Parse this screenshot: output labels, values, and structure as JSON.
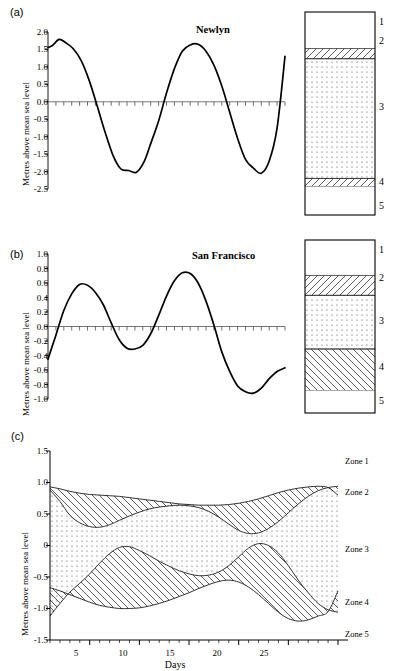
{
  "figure": {
    "panels": [
      {
        "tag": "(a)",
        "title": "Newlyn",
        "ylabel": "Metres above mean sea level",
        "yticks": [
          "2.0",
          "1.5",
          "1.0",
          "0.5",
          "0.0",
          "-0.5",
          "-1.0",
          "-1.5",
          "-2.0",
          "-2.5"
        ]
      },
      {
        "tag": "(b)",
        "title": "San Francisco",
        "ylabel": "Metres above mean sea level",
        "yticks": [
          "1.0",
          "0.8",
          "0.6",
          "0.4",
          "0.2",
          "0.0",
          "-0.2",
          "-0.4",
          "-0.6",
          "-0.8",
          "-1.0"
        ]
      },
      {
        "tag": "(c)",
        "title": "",
        "ylabel": "Metres above mean sea level",
        "xlabel": "Days",
        "yticks": [
          "1.5",
          "1.0",
          "0.5",
          "0",
          "-0.5",
          "-1.0",
          "-1.5"
        ],
        "xticks": [
          "5",
          "10",
          "15",
          "20",
          "25"
        ],
        "zone_labels": [
          "Zone 1",
          "Zone 2",
          "Zone 3",
          "Zone 4",
          "Zone 5"
        ]
      }
    ],
    "column_numbers": [
      "1",
      "2",
      "3",
      "4",
      "5"
    ]
  },
  "chart_data": [
    {
      "type": "line",
      "title": "Newlyn",
      "xlabel": "",
      "ylabel": "Metres above mean sea level",
      "ylim": [
        -2.5,
        2.0
      ],
      "xlim": [
        0,
        30
      ],
      "yticks": [
        2.0,
        1.5,
        1.0,
        0.5,
        0.0,
        -0.5,
        -1.0,
        -1.5,
        -2.0,
        -2.5
      ],
      "grid": false,
      "legend": "none",
      "series": [
        {
          "name": "Newlyn sea level",
          "x": [
            0,
            0.6,
            1.4,
            2.2,
            3.2,
            4.2,
            5.2,
            6.2,
            7.2,
            8.2,
            9.2,
            10.2,
            11.2,
            12.2,
            13.0,
            14.0,
            15.0,
            16.0,
            17.0,
            18.0,
            19.0,
            20.0,
            21.0,
            22.0,
            23.0,
            24.0,
            25.0,
            26.0,
            27.0,
            28.0,
            29.0,
            30.0
          ],
          "y": [
            1.55,
            1.62,
            1.79,
            1.7,
            1.52,
            1.18,
            0.62,
            -0.1,
            -0.85,
            -1.52,
            -1.92,
            -1.97,
            -2.02,
            -1.7,
            -1.2,
            -0.55,
            0.25,
            0.95,
            1.45,
            1.63,
            1.65,
            1.45,
            1.05,
            0.45,
            -0.3,
            -1.05,
            -1.65,
            -1.9,
            -2.05,
            -1.7,
            -0.75,
            1.3
          ]
        }
      ]
    },
    {
      "type": "line",
      "title": "San Francisco",
      "xlabel": "",
      "ylabel": "Metres above mean sea level",
      "ylim": [
        -1.0,
        1.0
      ],
      "xlim": [
        0,
        30
      ],
      "yticks": [
        1.0,
        0.8,
        0.6,
        0.4,
        0.2,
        0.0,
        -0.2,
        -0.4,
        -0.6,
        -0.8,
        -1.0
      ],
      "grid": false,
      "legend": "none",
      "series": [
        {
          "name": "San Francisco sea level",
          "x": [
            0,
            1,
            2,
            3,
            4,
            5,
            6,
            7,
            8,
            9,
            10,
            11,
            12,
            13,
            14,
            15,
            16,
            17,
            18,
            19,
            20,
            21,
            22,
            23,
            24,
            25,
            26,
            27,
            28,
            29,
            30
          ],
          "y": [
            -0.45,
            -0.12,
            0.22,
            0.45,
            0.58,
            0.57,
            0.47,
            0.3,
            0.05,
            -0.18,
            -0.3,
            -0.31,
            -0.26,
            -0.1,
            0.15,
            0.42,
            0.63,
            0.74,
            0.73,
            0.6,
            0.35,
            0.02,
            -0.35,
            -0.62,
            -0.82,
            -0.9,
            -0.92,
            -0.85,
            -0.72,
            -0.62,
            -0.57
          ]
        }
      ]
    },
    {
      "type": "area",
      "title": "",
      "xlabel": "Days",
      "ylabel": "Metres above mean sea level",
      "ylim": [
        -1.5,
        1.5
      ],
      "xlim": [
        1,
        30
      ],
      "yticks": [
        1.5,
        1.0,
        0.5,
        0,
        -0.5,
        -1.0,
        -1.5
      ],
      "xticks": [
        5,
        10,
        15,
        20,
        25
      ],
      "grid": false,
      "legend": "right",
      "zones": [
        "Zone 1",
        "Zone 2",
        "Zone 3",
        "Zone 4",
        "Zone 5"
      ],
      "series": [
        {
          "name": "upper-envelope-top (zone1/zone2 boundary)",
          "x": [
            1,
            2,
            3,
            4,
            5,
            6,
            7,
            8,
            9,
            10,
            11,
            12,
            13,
            14,
            15,
            16,
            17,
            18,
            19,
            20,
            21,
            22,
            23,
            24,
            25,
            26,
            27,
            28,
            29,
            30
          ],
          "y": [
            0.93,
            0.9,
            0.86,
            0.83,
            0.81,
            0.8,
            0.79,
            0.78,
            0.76,
            0.74,
            0.72,
            0.7,
            0.68,
            0.66,
            0.65,
            0.64,
            0.64,
            0.64,
            0.65,
            0.67,
            0.7,
            0.74,
            0.79,
            0.84,
            0.88,
            0.91,
            0.93,
            0.94,
            0.92,
            0.8
          ]
        },
        {
          "name": "upper-envelope-bottom (zone2/zone3 boundary)",
          "x": [
            1,
            2,
            3,
            4,
            5,
            6,
            7,
            8,
            9,
            10,
            11,
            12,
            13,
            14,
            15,
            16,
            17,
            18,
            19,
            20,
            21,
            22,
            23,
            24,
            25,
            26,
            27,
            28,
            29,
            30
          ],
          "y": [
            0.88,
            0.7,
            0.48,
            0.36,
            0.3,
            0.29,
            0.33,
            0.4,
            0.47,
            0.53,
            0.58,
            0.61,
            0.63,
            0.64,
            0.63,
            0.6,
            0.54,
            0.45,
            0.34,
            0.24,
            0.19,
            0.2,
            0.27,
            0.38,
            0.52,
            0.66,
            0.78,
            0.87,
            0.92,
            0.94
          ]
        },
        {
          "name": "lower-envelope-top (zone3/zone4 boundary)",
          "x": [
            1,
            2,
            3,
            4,
            5,
            6,
            7,
            8,
            9,
            10,
            11,
            12,
            13,
            14,
            15,
            16,
            17,
            18,
            19,
            20,
            21,
            22,
            23,
            24,
            25,
            26,
            27,
            28,
            29,
            30
          ],
          "y": [
            -1.12,
            -0.92,
            -0.74,
            -0.6,
            -0.45,
            -0.28,
            -0.13,
            -0.03,
            -0.02,
            -0.08,
            -0.16,
            -0.25,
            -0.33,
            -0.4,
            -0.45,
            -0.48,
            -0.47,
            -0.42,
            -0.32,
            -0.18,
            -0.04,
            0.03,
            0.0,
            -0.12,
            -0.32,
            -0.55,
            -0.75,
            -0.92,
            -1.02,
            -1.06
          ]
        },
        {
          "name": "lower-envelope-bottom (zone4/zone5 boundary)",
          "x": [
            1,
            2,
            3,
            4,
            5,
            6,
            7,
            8,
            9,
            10,
            11,
            12,
            13,
            14,
            15,
            16,
            17,
            18,
            19,
            20,
            21,
            22,
            23,
            24,
            25,
            26,
            27,
            28,
            29,
            30
          ],
          "y": [
            -0.67,
            -0.72,
            -0.78,
            -0.84,
            -0.9,
            -0.95,
            -0.98,
            -1.0,
            -1.0,
            -0.99,
            -0.96,
            -0.92,
            -0.87,
            -0.81,
            -0.75,
            -0.68,
            -0.62,
            -0.57,
            -0.55,
            -0.58,
            -0.66,
            -0.78,
            -0.92,
            -1.06,
            -1.16,
            -1.2,
            -1.18,
            -1.12,
            -1.05,
            -0.72
          ]
        }
      ]
    }
  ],
  "columns": [
    {
      "name": "newlyn-column",
      "zones": [
        {
          "num": "1",
          "fill": "white",
          "height_pct": 18.0
        },
        {
          "num": "2",
          "fill": "hatch-right",
          "height_pct": 5.0
        },
        {
          "num": "3",
          "fill": "dots",
          "height_pct": 59.0
        },
        {
          "num": "4",
          "fill": "hatch-right",
          "height_pct": 4.0
        },
        {
          "num": "5",
          "fill": "white",
          "height_pct": 14.0
        }
      ]
    },
    {
      "name": "sanfrancisco-column",
      "zones": [
        {
          "num": "1",
          "fill": "white",
          "height_pct": 20.5
        },
        {
          "num": "2",
          "fill": "hatch-right",
          "height_pct": 11.5
        },
        {
          "num": "3",
          "fill": "dots",
          "height_pct": 31.0
        },
        {
          "num": "4",
          "fill": "hatch-left",
          "height_pct": 24.0
        },
        {
          "num": "5",
          "fill": "white",
          "height_pct": 13.0
        }
      ]
    }
  ]
}
